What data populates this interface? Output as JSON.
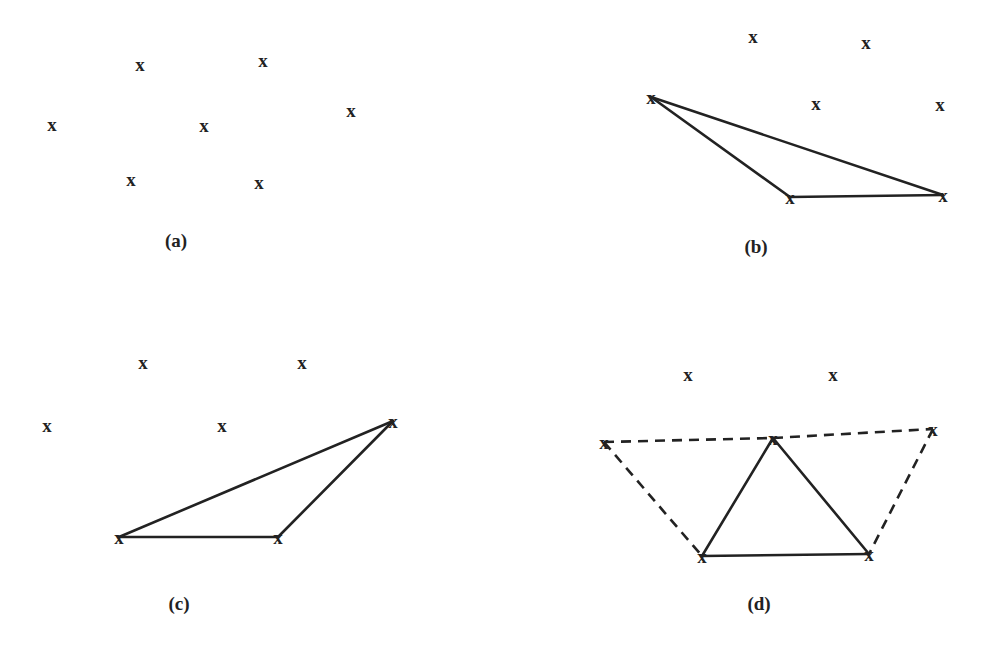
{
  "panels": [
    {
      "id": "a",
      "caption": "(a)",
      "caption_pos": [
        176,
        247
      ],
      "marker": "x",
      "points": [
        [
          140,
          64
        ],
        [
          263,
          60
        ],
        [
          52,
          124
        ],
        [
          204,
          125
        ],
        [
          351,
          110
        ],
        [
          131,
          179
        ],
        [
          259,
          182
        ]
      ],
      "solid_edges": [],
      "dashed_edges": []
    },
    {
      "id": "b",
      "caption": "(b)",
      "caption_pos": [
        756,
        253
      ],
      "marker": "x",
      "points": [
        [
          753,
          36
        ],
        [
          866,
          42
        ],
        [
          651,
          97
        ],
        [
          816,
          103
        ],
        [
          940,
          104
        ],
        [
          790,
          197
        ],
        [
          943,
          195
        ]
      ],
      "solid_edges": [
        [
          2,
          5
        ],
        [
          2,
          6
        ],
        [
          5,
          6
        ]
      ],
      "dashed_edges": []
    },
    {
      "id": "c",
      "caption": "(c)",
      "caption_pos": [
        179,
        610
      ],
      "marker": "x",
      "points": [
        [
          143,
          362
        ],
        [
          302,
          362
        ],
        [
          47,
          425
        ],
        [
          222,
          425
        ],
        [
          393,
          421
        ],
        [
          119,
          537
        ],
        [
          278,
          537
        ]
      ],
      "solid_edges": [
        [
          5,
          4
        ],
        [
          5,
          6
        ],
        [
          6,
          4
        ]
      ],
      "dashed_edges": []
    },
    {
      "id": "d",
      "caption": "(d)",
      "caption_pos": [
        759,
        610
      ],
      "marker": "x",
      "points": [
        [
          688,
          374
        ],
        [
          833,
          374
        ],
        [
          604,
          442
        ],
        [
          773,
          438
        ],
        [
          933,
          429
        ],
        [
          702,
          556
        ],
        [
          869,
          554
        ]
      ],
      "solid_edges": [
        [
          3,
          5
        ],
        [
          3,
          6
        ],
        [
          5,
          6
        ]
      ],
      "dashed_edges": [
        [
          2,
          3
        ],
        [
          3,
          4
        ],
        [
          2,
          5
        ],
        [
          4,
          6
        ]
      ]
    }
  ]
}
